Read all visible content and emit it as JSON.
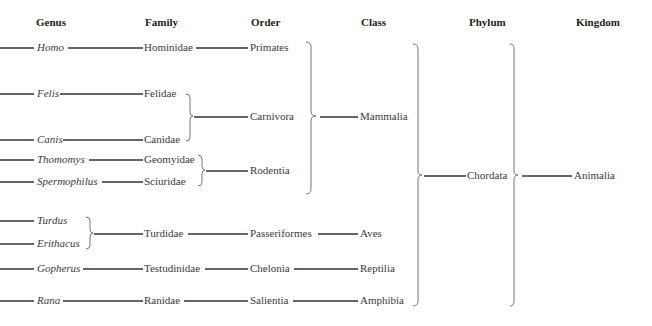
{
  "headers": {
    "genus": "Genus",
    "family": "Family",
    "order": "Order",
    "class": "Class",
    "phylum": "Phylum",
    "kingdom": "Kingdom"
  },
  "genera": [
    "Homo",
    "Felis",
    "Canis",
    "Thomomys",
    "Spermophilus",
    "Turdus",
    "Erithacus",
    "Gopherus",
    "Rana"
  ],
  "families": [
    "Hominidae",
    "Felidae",
    "Canidae",
    "Geomyidae",
    "Sciuridae",
    "Turdidae",
    "Testudinidae",
    "Ranidae"
  ],
  "orders": [
    "Primates",
    "Carnivora",
    "Rodentia",
    "Passeriformes",
    "Chelonia",
    "Salientia"
  ],
  "classes": [
    "Mammalia",
    "Aves",
    "Reptilia",
    "Amphibia"
  ],
  "phyla": [
    "Chordata"
  ],
  "kingdoms": [
    "Animalia"
  ]
}
